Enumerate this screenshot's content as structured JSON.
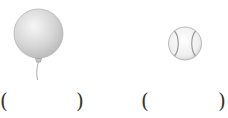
{
  "items": [
    {
      "name": "balloon",
      "icon": "balloon-icon",
      "answer_blank": {
        "open": "(",
        "close": ")",
        "value": ""
      }
    },
    {
      "name": "baseball",
      "icon": "baseball-icon",
      "answer_blank": {
        "open": "(",
        "close": ")",
        "value": ""
      }
    }
  ],
  "colors": {
    "balloon_fill": "#d9d9d9",
    "balloon_edge": "#b0b0b0",
    "ball_fill": "#f2f2f2",
    "ball_seam": "#9a9a9a",
    "paren": "#333333"
  }
}
